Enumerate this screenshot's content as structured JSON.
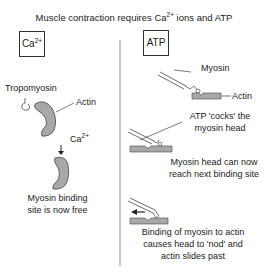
{
  "title": {
    "text": "Muscle contraction requires Ca",
    "sup": "2+",
    "rest": " ions and ATP"
  },
  "left_panel": {
    "box": {
      "text": "Ca",
      "sup": "2+"
    },
    "labels": {
      "tropomyosin": "Tropomyosin",
      "actin": "Actin",
      "ion": "Ca",
      "ion_sup": "2+"
    },
    "caption_lines": [
      "Myosin binding",
      "site is now free"
    ]
  },
  "right_panel": {
    "box": {
      "text": "ATP"
    },
    "labels": {
      "myosin": "Myosin",
      "actin": "Actin"
    },
    "step1_caption": [
      "ATP 'cocks' the",
      "myosin head"
    ],
    "step2_caption": [
      "Myosin head can now",
      "reach next binding site"
    ],
    "step3_caption": [
      "Binding of myosin to actin",
      "causes head to 'nod' and",
      "actin slides past"
    ]
  },
  "colors": {
    "shape_fill": "#a8a8a8",
    "stroke": "#444444",
    "divider": "#666666"
  }
}
